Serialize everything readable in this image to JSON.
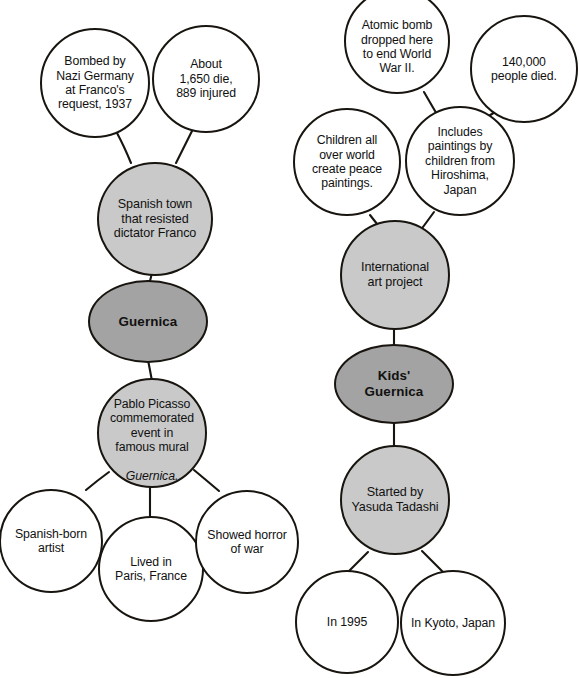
{
  "diagram": {
    "colors": {
      "root_fill": "#a3a3a3",
      "branch_fill": "#c9c9c9",
      "leaf_fill": "#ffffff",
      "outline": "#18140f",
      "text": "#111111",
      "background": "#ffffff"
    },
    "clusters": [
      {
        "id": "guernica",
        "root": {
          "label": "Guernica"
        },
        "nodes": [
          {
            "id": "g-bombed",
            "label": "Bombed by\nNazi Germany\nat Franco's\nrequest, 1937"
          },
          {
            "id": "g-casualties",
            "label": "About\n1,650 die,\n889 injured"
          },
          {
            "id": "g-town",
            "label": "Spanish town\nthat resisted\ndictator Franco"
          },
          {
            "id": "g-picasso",
            "label": "Pablo Picasso\ncommemorated\nevent in\nfamous mural"
          },
          {
            "id": "g-picasso-ital",
            "label": "Guernica."
          },
          {
            "id": "g-spanishborn",
            "label": "Spanish-born\nartist"
          },
          {
            "id": "g-paris",
            "label": "Lived in\nParis, France"
          },
          {
            "id": "g-horror",
            "label": "Showed horror\nof war"
          }
        ]
      },
      {
        "id": "kids-guernica",
        "root": {
          "label": "Kids'\nGuernica"
        },
        "nodes": [
          {
            "id": "k-atomic",
            "label": "Atomic bomb\ndropped here\nto end World\nWar II."
          },
          {
            "id": "k-died",
            "label": "140,000\npeople died."
          },
          {
            "id": "k-children",
            "label": "Children all\nover world\ncreate peace\npaintings."
          },
          {
            "id": "k-includes",
            "label": "Includes\npaintings by\nchildren from\nHiroshima,\nJapan"
          },
          {
            "id": "k-project",
            "label": "International\nart project"
          },
          {
            "id": "k-started",
            "label": "Started by\nYasuda Tadashi"
          },
          {
            "id": "k-year",
            "label": "In 1995"
          },
          {
            "id": "k-place",
            "label": "In Kyoto, Japan"
          }
        ]
      }
    ]
  }
}
